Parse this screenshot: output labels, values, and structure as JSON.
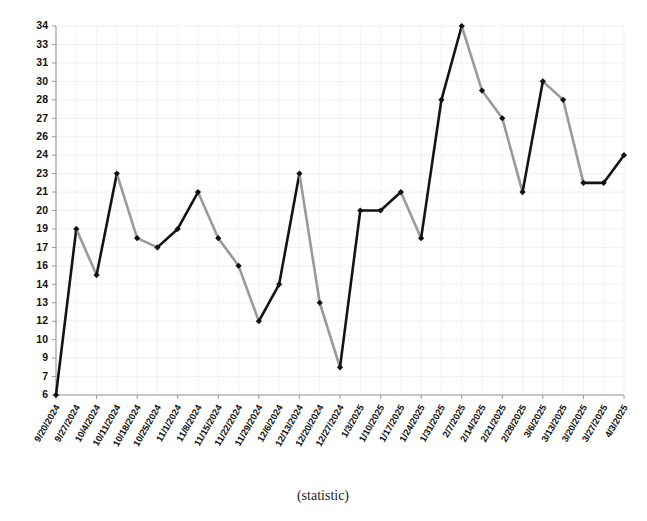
{
  "chart_data": {
    "type": "line",
    "title": "",
    "subtitle": "",
    "xlabel": "(statistic)",
    "ylabel": "",
    "grid": true,
    "legend": false,
    "legend_position": "none",
    "ylim": [
      6,
      34
    ],
    "y_ticks": [
      34,
      33,
      31,
      30,
      28,
      27,
      26,
      24,
      23,
      21,
      20,
      19,
      17,
      16,
      14,
      13,
      12,
      10,
      9,
      7,
      6
    ],
    "categories": [
      "9/20/2024",
      "9/27/2024",
      "10/4/2024",
      "10/11/2024",
      "10/18/2024",
      "10/25/2024",
      "11/1/2024",
      "11/8/2024",
      "11/15/2024",
      "11/22/2024",
      "11/29/2024",
      "12/6/2024",
      "12/13/2024",
      "12/20/2024",
      "12/27/2024",
      "1/3/2025",
      "1/10/2025",
      "1/17/2025",
      "1/24/2025",
      "1/31/2025",
      "2/7/2025",
      "2/14/2025",
      "2/21/2025",
      "2/28/2025",
      "3/6/2025",
      "3/13/2025",
      "3/20/2025",
      "3/27/2025",
      "4/3/2025"
    ],
    "values": [
      6,
      19,
      15,
      23,
      18,
      17,
      19,
      21,
      18,
      16,
      12,
      14,
      23,
      13,
      8,
      20,
      20,
      21,
      18,
      28,
      34,
      29,
      27,
      21,
      30,
      28,
      22,
      22,
      24
    ],
    "series": [
      {
        "name": "statistic",
        "values": [
          6,
          19,
          15,
          23,
          18,
          17,
          19,
          21,
          18,
          16,
          12,
          14,
          23,
          13,
          8,
          20,
          20,
          21,
          18,
          28,
          34,
          29,
          27,
          21,
          30,
          28,
          22,
          22,
          24
        ]
      }
    ],
    "colors": {
      "rising_segment": "#141414",
      "falling_segment": "#9a9a9a",
      "marker": "#111111",
      "gridline": "#e9e9ef",
      "axis": "#9a9a9a",
      "text": "#111111"
    },
    "marker_shape": "diamond"
  },
  "axis": {
    "x_title": "(statistic)"
  }
}
